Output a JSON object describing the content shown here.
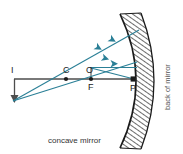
{
  "figure": {
    "type": "optics-ray-diagram",
    "caption": "concave mirror",
    "side_label": "back of mirror",
    "colors": {
      "ray": "#2a7f96",
      "axis": "#4d4d4d",
      "mirror": "#1a1a1a",
      "hatch": "#3a3a3a",
      "label": "#1a1a1a",
      "background": "#ffffff"
    },
    "points": [
      {
        "id": "I",
        "label": "I",
        "x": 14,
        "y": 76,
        "marker": "none",
        "label_dx": -4,
        "label_dy": -5
      },
      {
        "id": "C",
        "label": "C",
        "x": 66,
        "y": 79,
        "marker": "dot",
        "label_dx": -3,
        "label_dy": -6
      },
      {
        "id": "O",
        "label": "O",
        "x": 90,
        "y": 79,
        "marker": "none",
        "label_dx": -3,
        "label_dy": -6
      },
      {
        "id": "F",
        "label": "F",
        "x": 91,
        "y": 79,
        "marker": "dot",
        "label_dx": -3,
        "label_dy": 11
      },
      {
        "id": "P",
        "label": "P",
        "x": 133,
        "y": 79,
        "marker": "square",
        "label_dx": -3,
        "label_dy": 11
      }
    ],
    "axis": {
      "label": "principal axis",
      "x1": 14,
      "y1": 79,
      "x2": 137,
      "y2": 79
    },
    "object_arrow": {
      "label": "I",
      "x": 14,
      "y_top": 79,
      "y_bottom": 101,
      "direction": "down"
    },
    "mirror": {
      "shape": "concave arc",
      "vertex_x": 133,
      "top": {
        "x": 120,
        "y": 14
      },
      "bottom": {
        "x": 120,
        "y": 148
      },
      "hatching": "back side"
    },
    "rays": [
      {
        "id": "ray-upper",
        "from": {
          "x": 13,
          "y": 101
        },
        "to": {
          "x": 138,
          "y": 31
        },
        "arrowheads": 2
      },
      {
        "id": "ray-lower",
        "from": {
          "x": 13,
          "y": 101
        },
        "to": {
          "x": 137,
          "y": 62
        },
        "arrowheads": 1
      },
      {
        "id": "ray-horizontal",
        "from": {
          "x": 91,
          "y": 68
        },
        "to": {
          "x": 137,
          "y": 68
        },
        "arrowheads": 1
      },
      {
        "id": "ray-to-vertex",
        "from": {
          "x": 91,
          "y": 68
        },
        "to": {
          "x": 133,
          "y": 79
        },
        "arrowheads": 0
      }
    ],
    "connector": {
      "id": "object-segment",
      "x": 91,
      "y_top": 68,
      "y_bottom": 79
    }
  }
}
